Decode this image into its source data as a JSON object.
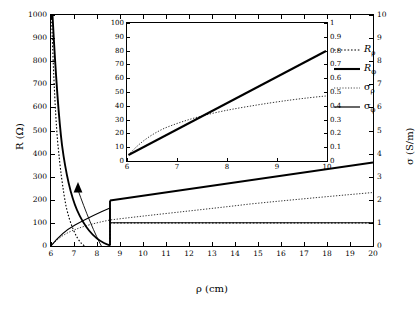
{
  "chart_data": {
    "type": "line",
    "title": "",
    "xlabel": "ρ (cm)",
    "ylabel_left": "R (Ω)",
    "ylabel_right": "σ (S/m)",
    "xlim": [
      6,
      20
    ],
    "ylim_left": [
      0,
      1000
    ],
    "ylim_right": [
      0,
      10
    ],
    "grid": false,
    "xticks": [
      6,
      7,
      8,
      9,
      10,
      11,
      12,
      13,
      14,
      15,
      16,
      17,
      18,
      19,
      20
    ],
    "xticklabels": [
      "6",
      "7",
      "8",
      "9",
      "10",
      "11",
      "12",
      "13",
      "14",
      "15",
      "16",
      "17",
      "18",
      "19",
      "20"
    ],
    "yticks_left": [
      0,
      100,
      200,
      300,
      400,
      500,
      600,
      700,
      800,
      900,
      1000
    ],
    "yticklabels_left": [
      "0",
      "100",
      "200",
      "300",
      "400",
      "500",
      "600",
      "700",
      "800",
      "900",
      "1000"
    ],
    "yticks_right": [
      0,
      1,
      2,
      3,
      4,
      5,
      6,
      7,
      8,
      9,
      10
    ],
    "yticklabels_right": [
      "0",
      "1",
      "2",
      "3",
      "4",
      "5",
      "6",
      "7",
      "8",
      "9",
      "10"
    ],
    "legend": [
      {
        "name": "R_rho",
        "label_main": "R",
        "label_sub": "ρ",
        "style": "dotted",
        "width": 1.2,
        "color": "#000000"
      },
      {
        "name": "R_phi",
        "label_main": "R",
        "label_sub": "φ",
        "style": "solid",
        "width": 2.2,
        "color": "#000000"
      },
      {
        "name": "sigma_rho",
        "label_main": "σ",
        "label_sub": "ρ",
        "style": "dotted",
        "width": 0.8,
        "color": "#000000"
      },
      {
        "name": "sigma_phi",
        "label_main": "σ",
        "label_sub": "φ",
        "style": "solid",
        "width": 1.2,
        "color": "#000000"
      }
    ],
    "series": [
      {
        "name": "R_rho",
        "axis": "left",
        "style": "dotted",
        "points": [
          [
            6.02,
            1000
          ],
          [
            6.1,
            860
          ],
          [
            6.2,
            720
          ],
          [
            6.3,
            620
          ],
          [
            6.4,
            540
          ],
          [
            6.5,
            478
          ],
          [
            6.6,
            425
          ],
          [
            6.7,
            382
          ],
          [
            6.8,
            346
          ],
          [
            6.9,
            315
          ],
          [
            7.0,
            288
          ],
          [
            7.2,
            245
          ],
          [
            7.4,
            211
          ],
          [
            7.6,
            184
          ],
          [
            7.8,
            162
          ],
          [
            8.0,
            144
          ],
          [
            8.5,
            110
          ],
          [
            9.0,
            86
          ],
          [
            9.5,
            70
          ],
          [
            10.0,
            58
          ],
          [
            10.0,
            100
          ],
          [
            12,
            100
          ],
          [
            14,
            100
          ],
          [
            16,
            100
          ],
          [
            18,
            100
          ],
          [
            20,
            100
          ]
        ]
      },
      {
        "name": "R_phi",
        "axis": "left",
        "style": "solid",
        "points": [
          [
            6.05,
            1000
          ],
          [
            6.2,
            860
          ],
          [
            6.4,
            680
          ],
          [
            6.6,
            560
          ],
          [
            6.8,
            470
          ],
          [
            7.0,
            400
          ],
          [
            7.2,
            348
          ],
          [
            7.4,
            305
          ],
          [
            7.6,
            270
          ],
          [
            7.8,
            242
          ],
          [
            8.0,
            218
          ],
          [
            8.5,
            172
          ],
          [
            9.0,
            140
          ],
          [
            9.5,
            116
          ],
          [
            10.0,
            98
          ],
          [
            10.0,
            196
          ],
          [
            11,
            208
          ],
          [
            12,
            222
          ],
          [
            13,
            238
          ],
          [
            14,
            254
          ],
          [
            15,
            272
          ],
          [
            16,
            290
          ],
          [
            17,
            308
          ],
          [
            18,
            326
          ],
          [
            19,
            344
          ],
          [
            20,
            362
          ]
        ]
      },
      {
        "name": "sigma_rho",
        "axis": "right",
        "style": "dotted-thin",
        "points": [
          [
            6,
            0
          ],
          [
            7,
            0.22
          ],
          [
            8,
            0.36
          ],
          [
            9,
            0.45
          ],
          [
            10,
            0.52
          ],
          [
            10,
            0.52
          ],
          [
            12,
            0.6
          ],
          [
            14,
            0.66
          ],
          [
            16,
            0.72
          ],
          [
            18,
            0.78
          ],
          [
            20,
            0.84
          ]
        ]
      },
      {
        "name": "sigma_phi",
        "axis": "right",
        "style": "solid-thin",
        "points": [
          [
            6,
            0
          ],
          [
            7,
            0.28
          ],
          [
            8,
            0.48
          ],
          [
            9,
            0.62
          ],
          [
            10,
            0.74
          ],
          [
            10,
            1.0
          ],
          [
            12,
            1.0
          ],
          [
            14,
            1.0
          ],
          [
            16,
            1.0
          ],
          [
            18,
            1.0
          ],
          [
            20,
            1.0
          ]
        ]
      }
    ],
    "inset": {
      "xlim": [
        6,
        10
      ],
      "ylim_left": [
        0,
        100
      ],
      "ylim_right": [
        0,
        1
      ],
      "xticks": [
        6,
        7,
        8,
        9,
        10
      ],
      "xticklabels": [
        "6",
        "7",
        "8",
        "9",
        "10"
      ],
      "yticks_left": [
        0,
        10,
        20,
        30,
        40,
        50,
        60,
        70,
        80,
        90,
        100
      ],
      "yticklabels_left": [
        "0",
        "10",
        "20",
        "30",
        "40",
        "50",
        "60",
        "70",
        "80",
        "90",
        "100"
      ],
      "yticks_right": [
        0,
        0.1,
        0.2,
        0.3,
        0.4,
        0.5,
        0.6,
        0.7,
        0.8,
        0.9,
        1
      ],
      "yticklabels_right": [
        "0",
        "0.1",
        "0.2",
        "0.3",
        "0.4",
        "0.5",
        "0.6",
        "0.7",
        "0.8",
        "0.9",
        "1"
      ],
      "series": [
        {
          "name": "sigma_phi_inset",
          "axis": "right",
          "style": "solid-thick",
          "points": [
            [
              6.05,
              0.045
            ],
            [
              7,
              0.23
            ],
            [
              8,
              0.42
            ],
            [
              9,
              0.61
            ],
            [
              10,
              0.8
            ]
          ]
        },
        {
          "name": "sigma_rho_inset",
          "axis": "right",
          "style": "dotted-thin",
          "points": [
            [
              6.05,
              0.045
            ],
            [
              6.5,
              0.13
            ],
            [
              7,
              0.2
            ],
            [
              7.5,
              0.26
            ],
            [
              8,
              0.31
            ],
            [
              8.5,
              0.35
            ],
            [
              9,
              0.39
            ],
            [
              9.5,
              0.42
            ],
            [
              10,
              0.445
            ]
          ]
        }
      ]
    },
    "annotation": {
      "type": "arrow",
      "from": [
        10.05,
        98
      ],
      "to": [
        6.6,
        300
      ],
      "description": "arrow from main curve region to inset origin"
    }
  }
}
